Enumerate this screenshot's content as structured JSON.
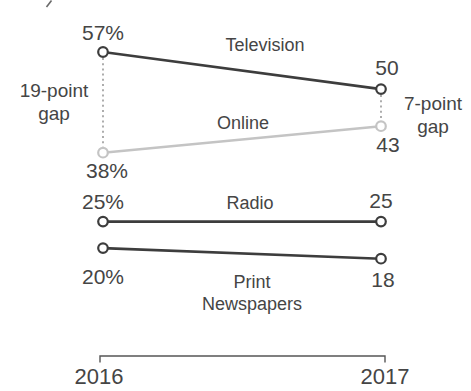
{
  "chart_data": {
    "type": "line",
    "variant": "slopegraph",
    "x_categories": [
      "2016",
      "2017"
    ],
    "series": [
      {
        "name": "Television",
        "values": [
          57,
          50
        ],
        "color": "#3d3d3d",
        "start_label": "57%",
        "end_label": "50"
      },
      {
        "name": "Online",
        "values": [
          38,
          43
        ],
        "color": "#c4c4c4",
        "start_label": "38%",
        "end_label": "43"
      },
      {
        "name": "Radio",
        "values": [
          25,
          25
        ],
        "color": "#3d3d3d",
        "start_label": "25%",
        "end_label": "25"
      },
      {
        "name": "Print Newspapers",
        "values": [
          20,
          18
        ],
        "color": "#3d3d3d",
        "start_label": "20%",
        "end_label": "18"
      }
    ],
    "annotations": [
      {
        "text": "19-point gap",
        "side": "left",
        "between": [
          "Television 2016",
          "Online 2016"
        ]
      },
      {
        "text": "7-point gap",
        "side": "right",
        "between": [
          "Television 2017",
          "Online 2017"
        ]
      }
    ],
    "value_range_implied": [
      18,
      57
    ],
    "legend": "inline-labels",
    "grid": false
  },
  "labels": {
    "television": {
      "name": "Television",
      "start": "57%",
      "end": "50"
    },
    "online": {
      "name": "Online",
      "start": "38%",
      "end": "43"
    },
    "radio": {
      "name": "Radio",
      "start": "25%",
      "end": "25"
    },
    "print": {
      "name_line1": "Print",
      "name_line2": "Newspapers",
      "start": "20%",
      "end": "18"
    },
    "gap_left": {
      "line1": "19-point",
      "line2": "gap"
    },
    "gap_right": {
      "line1": "7-point",
      "line2": "gap"
    },
    "axis": {
      "start_year": "2016",
      "end_year": "2017"
    }
  },
  "colors": {
    "dark_line": "#3d3d3d",
    "light_line": "#c4c4c4",
    "text": "#454545",
    "dotted": "#8a8a8a",
    "axis": "#565656",
    "background": "#ffffff"
  }
}
